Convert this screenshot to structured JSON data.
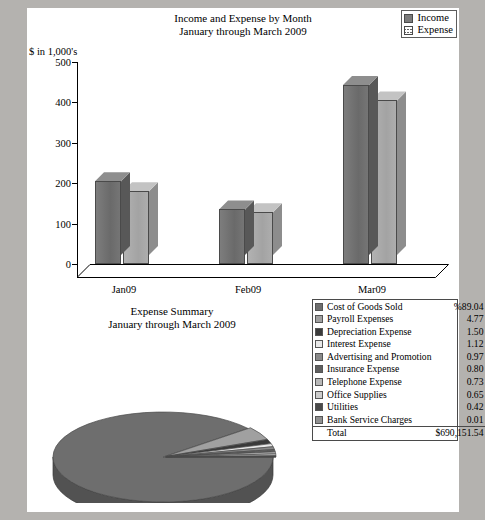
{
  "page": {
    "background": "#b4b2af",
    "paper": "#ffffff"
  },
  "bar_chart": {
    "title_line1": "Income and Expense by Month",
    "title_line2": "January through March 2009",
    "y_axis_label": "$ in 1,000's",
    "legend": [
      {
        "label": "Income",
        "swatch": "income-swatch",
        "color": "#6f6f6f"
      },
      {
        "label": "Expense",
        "swatch": "expense-swatch",
        "color": "#a8a8a8"
      }
    ]
  },
  "pie_chart": {
    "title_line1": "Expense Summary",
    "title_line2": "January through March 2009"
  },
  "expense_table": {
    "percent_header": "%89.04",
    "rows": [
      {
        "label": "Cost of Goods Sold",
        "value": "%89.04",
        "pct": 89.04,
        "color": "#6e6e6e"
      },
      {
        "label": "Payroll Expenses",
        "value": "4.77",
        "pct": 4.77,
        "color": "#a0a0a0"
      },
      {
        "label": "Depreciation Expense",
        "value": "1.50",
        "pct": 1.5,
        "color": "#3a3a3a"
      },
      {
        "label": "Interest Expense",
        "value": "1.12",
        "pct": 1.12,
        "color": "#e8e8e8"
      },
      {
        "label": "Advertising and Promotion",
        "value": "0.97",
        "pct": 0.97,
        "color": "#8a8a8a"
      },
      {
        "label": "Insurance Expense",
        "value": "0.80",
        "pct": 0.8,
        "color": "#5f5f5f"
      },
      {
        "label": "Telephone Expense",
        "value": "0.73",
        "pct": 0.73,
        "color": "#b8b8b8"
      },
      {
        "label": "Office Supplies",
        "value": "0.65",
        "pct": 0.65,
        "color": "#cccccc"
      },
      {
        "label": "Utilities",
        "value": "0.42",
        "pct": 0.42,
        "color": "#4a4a4a"
      },
      {
        "label": "Bank Service Charges",
        "value": "0.01",
        "pct": 0.01,
        "color": "#909090"
      }
    ],
    "total_label": "Total",
    "total_value": "$690,151.54"
  },
  "chart_data": [
    {
      "type": "bar",
      "title": "Income and Expense by Month\nJanuary through March 2009",
      "xlabel": "",
      "ylabel": "$ in 1,000's",
      "ylim": [
        0,
        500
      ],
      "yticks": [
        0,
        100,
        200,
        300,
        400,
        500
      ],
      "grid": false,
      "legend_position": "top-right",
      "categories": [
        "Jan09",
        "Feb09",
        "Mar09"
      ],
      "series": [
        {
          "name": "Income",
          "values": [
            205,
            135,
            443
          ]
        },
        {
          "name": "Expense",
          "values": [
            180,
            128,
            405
          ]
        }
      ]
    },
    {
      "type": "pie",
      "title": "Expense Summary\nJanuary through March 2009",
      "legend_position": "right",
      "total": "$690,151.54",
      "labels": [
        "Cost of Goods Sold",
        "Payroll Expenses",
        "Depreciation Expense",
        "Interest Expense",
        "Advertising and Promotion",
        "Insurance Expense",
        "Telephone Expense",
        "Office Supplies",
        "Utilities",
        "Bank Service Charges"
      ],
      "values": [
        89.04,
        4.77,
        1.5,
        1.12,
        0.97,
        0.8,
        0.73,
        0.65,
        0.42,
        0.01
      ]
    }
  ]
}
